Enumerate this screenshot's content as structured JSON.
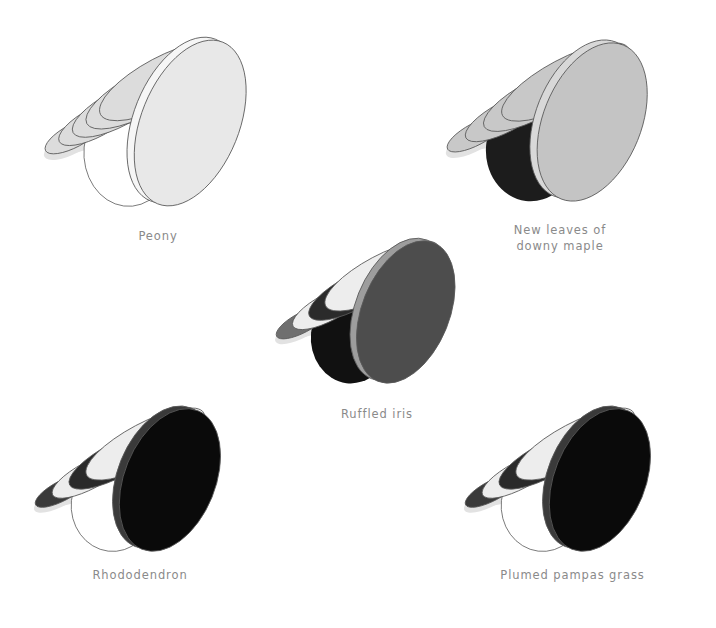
{
  "figure_title": "Flower-form disc stack diagrams",
  "canvas": {
    "width": 716,
    "height": 628,
    "background": "#ffffff"
  },
  "style": {
    "caption_color": "#8a8a8a",
    "outline_color": "#595959",
    "shadow_color": "#e2e2e2"
  },
  "figures": [
    {
      "id": "peony",
      "label": "Peony",
      "position": {
        "x": 18,
        "y": 18,
        "w": 280,
        "h": 210
      },
      "caption_pos": {
        "x": 18,
        "y": 228,
        "w": 280
      },
      "front_disc_color": "#e8e8e8",
      "bowl_color": "#ffffff",
      "rim_color": "#f6f6f6",
      "layer_colors": [
        "#dcdcdc",
        "#dcdcdc",
        "#dcdcdc",
        "#dcdcdc",
        "#dcdcdc"
      ],
      "layer_count": 5
    },
    {
      "id": "new-leaves-of-downy-maple",
      "label": "New leaves of\ndowny maple",
      "position": {
        "x": 420,
        "y": 22,
        "w": 280,
        "h": 200
      },
      "caption_pos": {
        "x": 430,
        "y": 222,
        "w": 260
      },
      "front_disc_color": "#c4c4c4",
      "bowl_color": "#1c1c1c",
      "rim_color": "#d8d8d8",
      "layer_colors": [
        "#c8c8c8",
        "#c8c8c8",
        "#c8c8c8",
        "#c8c8c8"
      ],
      "layer_count": 4
    },
    {
      "id": "ruffled-iris",
      "label": "Ruffled iris",
      "position": {
        "x": 252,
        "y": 222,
        "w": 250,
        "h": 180
      },
      "caption_pos": {
        "x": 262,
        "y": 406,
        "w": 230
      },
      "front_disc_color": "#4d4d4d",
      "bowl_color": "#111111",
      "rim_color": "#9d9d9d",
      "layer_colors": [
        "#6f6f6f",
        "#ededed",
        "#2b2b2b",
        "#ededed"
      ],
      "layer_count": 4
    },
    {
      "id": "rhododendron",
      "label": "Rhododendron",
      "position": {
        "x": 10,
        "y": 390,
        "w": 260,
        "h": 180
      },
      "caption_pos": {
        "x": 15,
        "y": 567,
        "w": 250
      },
      "front_disc_color": "#0a0a0a",
      "bowl_color": "#ffffff",
      "rim_color": "#3a3a3a",
      "layer_colors": [
        "#3a3a3a",
        "#ededed",
        "#2a2a2a",
        "#ededed"
      ],
      "layer_count": 4
    },
    {
      "id": "plumed-pampas-grass",
      "label": "Plumed pampas grass",
      "position": {
        "x": 440,
        "y": 390,
        "w": 260,
        "h": 180
      },
      "caption_pos": {
        "x": 450,
        "y": 567,
        "w": 245
      },
      "front_disc_color": "#0a0a0a",
      "bowl_color": "#ffffff",
      "rim_color": "#3a3a3a",
      "layer_colors": [
        "#3a3a3a",
        "#ededed",
        "#2a2a2a",
        "#ededed"
      ],
      "layer_count": 4
    }
  ]
}
